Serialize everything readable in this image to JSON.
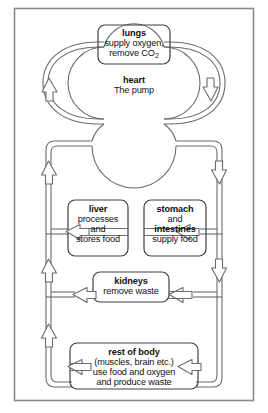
{
  "diagram": {
    "frame": {
      "border_color": "#8a8a8a"
    },
    "colors": {
      "vessel_stroke": "#6b6b6b",
      "box_stroke": "#3f3f3f",
      "text": "#111111",
      "background": "#ffffff"
    },
    "nodes": [
      {
        "id": "lungs",
        "title": "lungs",
        "lines": [
          {
            "text": "supply oxygen,",
            "bold": false
          },
          {
            "text": "remove CO",
            "bold": false,
            "subscript": "2"
          }
        ]
      },
      {
        "id": "heart",
        "title": "heart",
        "lines": [
          {
            "text": "The pump",
            "bold": false
          }
        ]
      },
      {
        "id": "liver",
        "title": "liver",
        "lines": [
          {
            "text": "processes",
            "bold": false
          },
          {
            "text": "and",
            "bold": false
          },
          {
            "text": "stores food",
            "bold": false
          }
        ]
      },
      {
        "id": "stomach-intestines",
        "title": "stomach",
        "lines": [
          {
            "text": "and",
            "bold": false
          },
          {
            "text": "intestines",
            "bold": true
          },
          {
            "text": "supply food",
            "bold": false
          }
        ]
      },
      {
        "id": "kidneys",
        "title": "kidneys",
        "lines": [
          {
            "text": "remove waste",
            "bold": false
          }
        ]
      },
      {
        "id": "rest-of-body",
        "title": "rest of body",
        "lines": [
          {
            "text": "(muscles, brain etc.)",
            "bold": false
          },
          {
            "text": "use food and oxygen",
            "bold": false
          },
          {
            "text": "and produce waste",
            "bold": false
          }
        ]
      }
    ],
    "flow": [
      {
        "from": "heart",
        "to": "lungs",
        "direction": "up",
        "side": "left"
      },
      {
        "from": "lungs",
        "to": "heart",
        "direction": "down",
        "side": "right"
      },
      {
        "from": "heart",
        "to": "stomach-intestines",
        "direction": "down",
        "side": "right"
      },
      {
        "from": "heart",
        "to": "kidneys",
        "direction": "down",
        "side": "right"
      },
      {
        "from": "heart",
        "to": "rest-of-body",
        "direction": "down",
        "side": "right"
      },
      {
        "from": "liver",
        "to": "heart",
        "direction": "up",
        "side": "left"
      },
      {
        "from": "kidneys",
        "to": "heart",
        "direction": "up",
        "side": "left"
      },
      {
        "from": "rest-of-body",
        "to": "heart",
        "direction": "up",
        "side": "left"
      }
    ]
  }
}
